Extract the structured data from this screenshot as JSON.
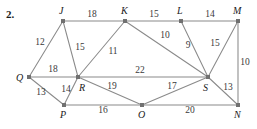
{
  "problem": {
    "number": "2."
  },
  "graph": {
    "type": "weighted-undirected-graph",
    "colors": {
      "edge": "#8a8a8a",
      "vertex": "#707070",
      "label": "#1a1a1a",
      "weight": "#3a3a3a",
      "background": "#ffffff"
    },
    "vertices": [
      {
        "id": "J",
        "label": "J",
        "x": 63,
        "y": 21,
        "lx": 59,
        "ly": 14
      },
      {
        "id": "K",
        "label": "K",
        "x": 125,
        "y": 21,
        "lx": 121,
        "ly": 14
      },
      {
        "id": "L",
        "label": "L",
        "x": 181,
        "y": 21,
        "lx": 177,
        "ly": 14
      },
      {
        "id": "M",
        "label": "M",
        "x": 238,
        "y": 21,
        "lx": 233,
        "ly": 14
      },
      {
        "id": "Q",
        "label": "Q",
        "x": 29,
        "y": 77,
        "lx": 16,
        "ly": 81
      },
      {
        "id": "R",
        "label": "R",
        "x": 78,
        "y": 77,
        "lx": 79,
        "ly": 91
      },
      {
        "id": "S",
        "label": "S",
        "x": 208,
        "y": 77,
        "lx": 203,
        "ly": 91
      },
      {
        "id": "P",
        "label": "P",
        "x": 64,
        "y": 105,
        "lx": 60,
        "ly": 118
      },
      {
        "id": "O",
        "label": "O",
        "x": 142,
        "y": 105,
        "lx": 138,
        "ly": 118
      },
      {
        "id": "N",
        "label": "N",
        "x": 238,
        "y": 105,
        "lx": 234,
        "ly": 118
      }
    ],
    "edges": [
      {
        "from": "J",
        "to": "K",
        "weight": "18",
        "wx": 92,
        "wy": 17
      },
      {
        "from": "K",
        "to": "L",
        "weight": "15",
        "wx": 154,
        "wy": 17
      },
      {
        "from": "L",
        "to": "M",
        "weight": "14",
        "wx": 210,
        "wy": 17
      },
      {
        "from": "J",
        "to": "Q",
        "weight": "12",
        "wx": 40,
        "wy": 45
      },
      {
        "from": "J",
        "to": "R",
        "weight": "15",
        "wx": 80,
        "wy": 50
      },
      {
        "from": "K",
        "to": "R",
        "weight": "11",
        "wx": 113,
        "wy": 54
      },
      {
        "from": "K",
        "to": "S",
        "weight": "10",
        "wx": 165,
        "wy": 38
      },
      {
        "from": "L",
        "to": "S",
        "weight": "9",
        "wx": 188,
        "wy": 48
      },
      {
        "from": "M",
        "to": "S",
        "weight": "15",
        "wx": 215,
        "wy": 46
      },
      {
        "from": "M",
        "to": "N",
        "weight": "10",
        "wx": 245,
        "wy": 65
      },
      {
        "from": "Q",
        "to": "R",
        "weight": "18",
        "wx": 53,
        "wy": 72
      },
      {
        "from": "Q",
        "to": "P",
        "weight": "13",
        "wx": 41,
        "wy": 95
      },
      {
        "from": "R",
        "to": "P",
        "weight": "14",
        "wx": 66,
        "wy": 92
      },
      {
        "from": "R",
        "to": "S",
        "weight": "22",
        "wx": 140,
        "wy": 73
      },
      {
        "from": "R",
        "to": "O",
        "weight": "19",
        "wx": 112,
        "wy": 89
      },
      {
        "from": "O",
        "to": "S",
        "weight": "17",
        "wx": 172,
        "wy": 89
      },
      {
        "from": "P",
        "to": "O",
        "weight": "16",
        "wx": 103,
        "wy": 113
      },
      {
        "from": "O",
        "to": "N",
        "weight": "20",
        "wx": 190,
        "wy": 113
      },
      {
        "from": "S",
        "to": "N",
        "weight": "13",
        "wx": 228,
        "wy": 90
      }
    ]
  }
}
